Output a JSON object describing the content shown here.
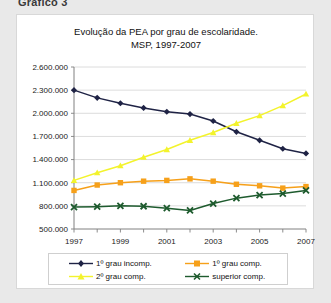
{
  "figure_caption": "Gráfico 3",
  "chart_data": {
    "type": "line",
    "title": "Evolução da PEA por grau de escolaridade.",
    "subtitle": "MSP, 1997-2007",
    "xlabel": "",
    "ylabel": "",
    "x": [
      1997,
      1998,
      1999,
      2000,
      2001,
      2002,
      2003,
      2004,
      2005,
      2006,
      2007
    ],
    "xtick_labels": [
      "1997",
      "",
      "1999",
      "",
      "2001",
      "",
      "2003",
      "",
      "2005",
      "",
      "2007"
    ],
    "xtick_labels_shown": [
      "1997",
      "1999",
      "2001",
      "2003",
      "2005",
      "2007"
    ],
    "ytick_labels": [
      "2.600.000",
      "2.300.000",
      "2.000.000",
      "1.700.000",
      "1.400.000",
      "1.100.000",
      "800.000",
      "500.000"
    ],
    "ylim": [
      500000,
      2600000
    ],
    "ytick_step": 300000,
    "grid": true,
    "legend_position": "bottom",
    "series": [
      {
        "name": "1º grau incomp.",
        "color": "#1f2345",
        "marker": "diamond",
        "values": [
          2300000,
          2200000,
          2130000,
          2070000,
          2020000,
          1990000,
          1900000,
          1760000,
          1650000,
          1540000,
          1480000
        ]
      },
      {
        "name": "1º grau comp.",
        "color": "#F6A01A",
        "marker": "square",
        "values": [
          1000000,
          1070000,
          1100000,
          1120000,
          1130000,
          1150000,
          1120000,
          1080000,
          1060000,
          1030000,
          1050000
        ]
      },
      {
        "name": "2º grau comp.",
        "color": "#F3F32C",
        "marker": "triangle",
        "values": [
          1130000,
          1230000,
          1320000,
          1430000,
          1530000,
          1650000,
          1750000,
          1870000,
          1970000,
          2100000,
          2250000
        ]
      },
      {
        "name": "superior comp.",
        "color": "#1E5B2E",
        "marker": "x",
        "values": [
          785000,
          790000,
          800000,
          795000,
          770000,
          740000,
          830000,
          900000,
          940000,
          960000,
          1000000
        ]
      }
    ]
  }
}
